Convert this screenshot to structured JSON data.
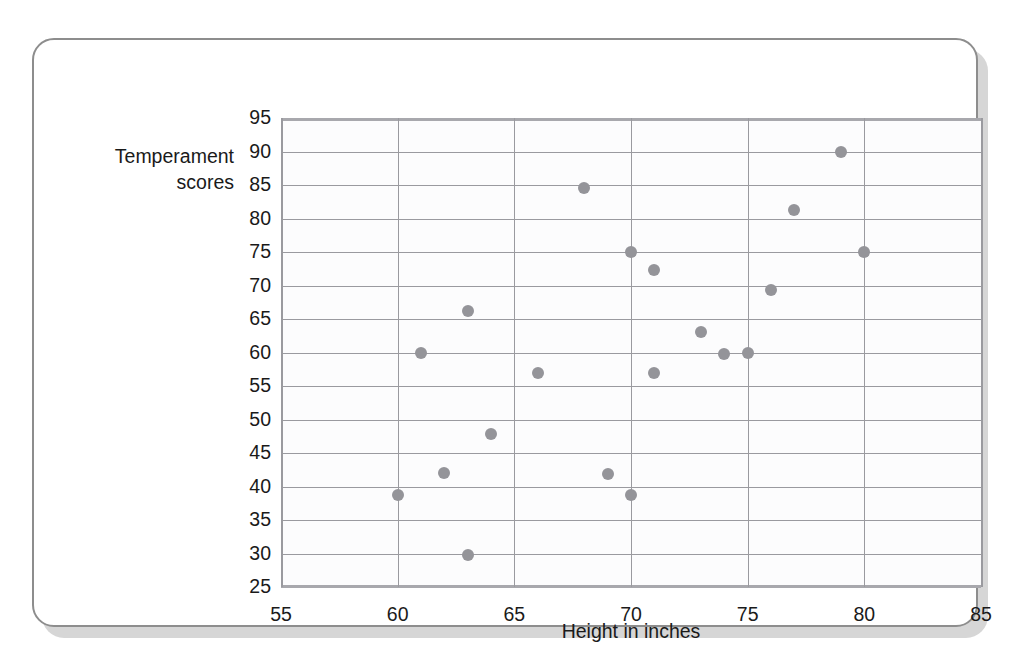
{
  "chart_data": {
    "type": "scatter",
    "title": "",
    "xlabel": "Height in inches",
    "ylabel": "Temperament\nscores",
    "xlim": [
      55,
      85
    ],
    "ylim": [
      25,
      95
    ],
    "xticks": [
      55,
      60,
      65,
      70,
      75,
      80,
      85
    ],
    "yticks": [
      25,
      30,
      35,
      40,
      45,
      50,
      55,
      60,
      65,
      70,
      75,
      80,
      85,
      90,
      95
    ],
    "grid": true,
    "legend": null,
    "marker_color": "#949499",
    "grid_color": "#9a9a9f",
    "points": [
      {
        "x": 60,
        "y": 38.7
      },
      {
        "x": 61,
        "y": 60.0
      },
      {
        "x": 62,
        "y": 42.0
      },
      {
        "x": 63,
        "y": 66.2
      },
      {
        "x": 63,
        "y": 29.8
      },
      {
        "x": 64,
        "y": 47.8
      },
      {
        "x": 66,
        "y": 57.0
      },
      {
        "x": 68,
        "y": 84.5
      },
      {
        "x": 69,
        "y": 41.8
      },
      {
        "x": 70,
        "y": 75.0
      },
      {
        "x": 70,
        "y": 38.7
      },
      {
        "x": 71,
        "y": 72.3
      },
      {
        "x": 71,
        "y": 57.0
      },
      {
        "x": 73,
        "y": 63.0
      },
      {
        "x": 74,
        "y": 59.8
      },
      {
        "x": 75,
        "y": 60.0
      },
      {
        "x": 76,
        "y": 69.3
      },
      {
        "x": 77,
        "y": 81.3
      },
      {
        "x": 79,
        "y": 90.0
      },
      {
        "x": 80,
        "y": 75.0
      }
    ]
  }
}
